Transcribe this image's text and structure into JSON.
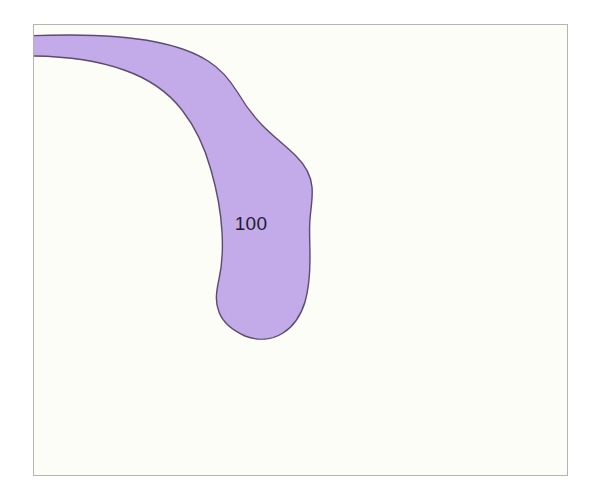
{
  "figure": {
    "title": "",
    "background_color": "#ffffff",
    "plot_background_color": "#fdfdf7",
    "frame_color": "#b4b4b4",
    "width": 602,
    "height": 501
  },
  "contour": {
    "label": "100",
    "label_x": 251,
    "label_y": 230,
    "fill_color": "#c3abe9",
    "outline_color": "#5d4a6e",
    "outline_width": 1.4,
    "level_value": 100,
    "units": "",
    "region_name": "contour-region-100"
  },
  "chart_data": {
    "type": "contour",
    "title": "",
    "xlabel": "",
    "ylabel": "",
    "levels": [
      100
    ],
    "level_labels": [
      "100"
    ],
    "fill_colors": [
      "#c3abe9"
    ],
    "grid": false,
    "legend": "none",
    "axis_ticks": []
  }
}
